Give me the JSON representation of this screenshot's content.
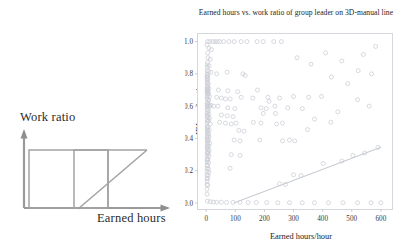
{
  "schematic": {
    "name": "work-ratio-vs-earned-hours-schematic",
    "ylabel": "Work ratio",
    "xlabel": "Earned hours",
    "line_color": "#9a9a9a"
  },
  "chart_data": {
    "type": "scatter",
    "title": "Earned hours vs. work ratio of group leader on 3D-manual line",
    "xlabel": "Earned hours/hour",
    "ylabel": "IDL work ratio",
    "xlim": [
      -30,
      640
    ],
    "ylim": [
      -0.04,
      1.05
    ],
    "xticks": [
      0,
      100,
      200,
      300,
      400,
      500,
      600
    ],
    "xtick_labels": [
      "0",
      "100",
      "200",
      "300",
      "400",
      "500",
      "600"
    ],
    "yticks": [
      0.0,
      0.2,
      0.4,
      0.6,
      0.8,
      1.0
    ],
    "ytick_labels": [
      "0.0",
      "0.2",
      "0.4",
      "0.6",
      "0.8",
      "1.0"
    ],
    "grid": false,
    "legend": "none",
    "marker_color": "#c9ccd4",
    "marker_size": 2.0,
    "trendline": {
      "name": "linear-fit",
      "color": "#c9ccd4",
      "x": [
        95,
        600
      ],
      "y": [
        0.0,
        0.345
      ]
    },
    "points": [
      [
        4,
        1.0
      ],
      [
        12,
        1.0
      ],
      [
        22,
        1.0
      ],
      [
        30,
        1.0
      ],
      [
        38,
        1.0
      ],
      [
        46,
        1.0
      ],
      [
        60,
        1.0
      ],
      [
        78,
        1.0
      ],
      [
        96,
        1.0
      ],
      [
        120,
        1.0
      ],
      [
        140,
        1.0
      ],
      [
        175,
        1.0
      ],
      [
        196,
        1.0
      ],
      [
        232,
        1.0
      ],
      [
        258,
        1.0
      ],
      [
        3,
        0.98
      ],
      [
        9,
        0.96
      ],
      [
        18,
        0.95
      ],
      [
        5,
        0.93
      ],
      [
        6,
        0.9
      ],
      [
        14,
        0.89
      ],
      [
        4,
        0.87
      ],
      [
        3,
        0.855
      ],
      [
        10,
        0.85
      ],
      [
        4,
        0.84
      ],
      [
        3,
        0.82
      ],
      [
        8,
        0.815
      ],
      [
        16,
        0.81
      ],
      [
        3,
        0.8
      ],
      [
        5,
        0.795
      ],
      [
        4,
        0.785
      ],
      [
        3,
        0.78
      ],
      [
        6,
        0.77
      ],
      [
        3,
        0.765
      ],
      [
        4,
        0.755
      ],
      [
        36,
        0.8
      ],
      [
        72,
        0.81
      ],
      [
        126,
        0.8
      ],
      [
        134,
        0.79
      ],
      [
        3,
        0.745
      ],
      [
        7,
        0.74
      ],
      [
        5,
        0.73
      ],
      [
        4,
        0.72
      ],
      [
        3,
        0.715
      ],
      [
        9,
        0.71
      ],
      [
        4,
        0.705
      ],
      [
        3,
        0.7
      ],
      [
        6,
        0.695
      ],
      [
        4,
        0.69
      ],
      [
        3,
        0.685
      ],
      [
        8,
        0.68
      ],
      [
        5,
        0.675
      ],
      [
        42,
        0.7
      ],
      [
        74,
        0.695
      ],
      [
        108,
        0.69
      ],
      [
        176,
        0.7
      ],
      [
        3,
        0.665
      ],
      [
        11,
        0.66
      ],
      [
        4,
        0.655
      ],
      [
        3,
        0.645
      ],
      [
        6,
        0.64
      ],
      [
        9,
        0.635
      ],
      [
        36,
        0.655
      ],
      [
        52,
        0.65
      ],
      [
        66,
        0.645
      ],
      [
        82,
        0.645
      ],
      [
        120,
        0.655
      ],
      [
        160,
        0.65
      ],
      [
        212,
        0.655
      ],
      [
        252,
        0.65
      ],
      [
        300,
        0.66
      ],
      [
        352,
        0.655
      ],
      [
        396,
        0.66
      ],
      [
        3,
        0.62
      ],
      [
        5,
        0.615
      ],
      [
        8,
        0.61
      ],
      [
        4,
        0.605
      ],
      [
        3,
        0.6
      ],
      [
        12,
        0.6
      ],
      [
        6,
        0.595
      ],
      [
        16,
        0.605
      ],
      [
        26,
        0.6
      ],
      [
        40,
        0.6
      ],
      [
        3,
        0.58
      ],
      [
        7,
        0.575
      ],
      [
        5,
        0.565
      ],
      [
        74,
        0.59
      ],
      [
        98,
        0.585
      ],
      [
        188,
        0.59
      ],
      [
        206,
        0.585
      ],
      [
        280,
        0.59
      ],
      [
        330,
        0.585
      ],
      [
        3,
        0.555
      ],
      [
        9,
        0.55
      ],
      [
        4,
        0.545
      ],
      [
        3,
        0.535
      ],
      [
        6,
        0.53
      ],
      [
        11,
        0.525
      ],
      [
        52,
        0.545
      ],
      [
        72,
        0.54
      ],
      [
        92,
        0.535
      ],
      [
        3,
        0.515
      ],
      [
        8,
        0.51
      ],
      [
        5,
        0.505
      ],
      [
        3,
        0.495
      ],
      [
        14,
        0.49
      ],
      [
        46,
        0.5
      ],
      [
        66,
        0.495
      ],
      [
        86,
        0.49
      ],
      [
        102,
        0.495
      ],
      [
        162,
        0.5
      ],
      [
        188,
        0.495
      ],
      [
        262,
        0.495
      ],
      [
        3,
        0.475
      ],
      [
        7,
        0.47
      ],
      [
        4,
        0.465
      ],
      [
        3,
        0.455
      ],
      [
        10,
        0.45
      ],
      [
        5,
        0.445
      ],
      [
        3,
        0.435
      ],
      [
        6,
        0.43
      ],
      [
        8,
        0.425
      ],
      [
        112,
        0.45
      ],
      [
        130,
        0.445
      ],
      [
        3,
        0.415
      ],
      [
        9,
        0.41
      ],
      [
        4,
        0.405
      ],
      [
        3,
        0.395
      ],
      [
        7,
        0.39
      ],
      [
        5,
        0.385
      ],
      [
        3,
        0.375
      ],
      [
        12,
        0.37
      ],
      [
        6,
        0.365
      ],
      [
        96,
        0.39
      ],
      [
        116,
        0.385
      ],
      [
        184,
        0.39
      ],
      [
        262,
        0.385
      ],
      [
        286,
        0.39
      ],
      [
        304,
        0.385
      ],
      [
        3,
        0.355
      ],
      [
        8,
        0.35
      ],
      [
        4,
        0.345
      ],
      [
        3,
        0.335
      ],
      [
        6,
        0.33
      ],
      [
        10,
        0.325
      ],
      [
        3,
        0.315
      ],
      [
        7,
        0.31
      ],
      [
        5,
        0.305
      ],
      [
        3,
        0.295
      ],
      [
        9,
        0.29
      ],
      [
        3,
        0.275
      ],
      [
        6,
        0.27
      ],
      [
        4,
        0.265
      ],
      [
        86,
        0.3
      ],
      [
        116,
        0.295
      ],
      [
        3,
        0.255
      ],
      [
        8,
        0.25
      ],
      [
        3,
        0.235
      ],
      [
        5,
        0.23
      ],
      [
        3,
        0.215
      ],
      [
        7,
        0.21
      ],
      [
        3,
        0.195
      ],
      [
        9,
        0.19
      ],
      [
        82,
        0.215
      ],
      [
        3,
        0.175
      ],
      [
        6,
        0.17
      ],
      [
        3,
        0.155
      ],
      [
        4,
        0.15
      ],
      [
        3,
        0.135
      ],
      [
        3,
        0.115
      ],
      [
        5,
        0.11
      ],
      [
        3,
        0.085
      ],
      [
        3,
        0.055
      ],
      [
        4,
        0.012
      ],
      [
        14,
        0.008
      ],
      [
        24,
        0.006
      ],
      [
        36,
        0.005
      ],
      [
        52,
        0.005
      ],
      [
        70,
        0.004
      ],
      [
        92,
        0.004
      ],
      [
        116,
        0.004
      ],
      [
        144,
        0.003
      ],
      [
        172,
        0.003
      ],
      [
        208,
        0.003
      ],
      [
        246,
        0.002
      ],
      [
        286,
        0.002
      ],
      [
        330,
        0.002
      ],
      [
        372,
        0.002
      ],
      [
        420,
        0.002
      ],
      [
        470,
        0.002
      ],
      [
        520,
        0.002
      ],
      [
        566,
        0.002
      ],
      [
        600,
        0.002
      ],
      [
        252,
        0.12
      ],
      [
        272,
        0.115
      ],
      [
        300,
        0.175
      ],
      [
        326,
        0.17
      ],
      [
        402,
        0.245
      ],
      [
        466,
        0.26
      ],
      [
        504,
        0.295
      ],
      [
        544,
        0.31
      ],
      [
        590,
        0.345
      ],
      [
        196,
        0.555
      ],
      [
        216,
        0.63
      ],
      [
        236,
        0.6
      ],
      [
        238,
        0.555
      ],
      [
        242,
        0.49
      ],
      [
        348,
        0.455
      ],
      [
        372,
        0.52
      ],
      [
        428,
        0.5
      ],
      [
        452,
        0.565
      ],
      [
        520,
        0.64
      ],
      [
        560,
        0.6
      ],
      [
        430,
        0.78
      ],
      [
        486,
        0.74
      ],
      [
        522,
        0.82
      ],
      [
        568,
        0.8
      ],
      [
        312,
        0.9
      ],
      [
        360,
        0.86
      ],
      [
        410,
        0.93
      ],
      [
        466,
        0.88
      ],
      [
        540,
        0.92
      ],
      [
        582,
        0.97
      ]
    ]
  }
}
